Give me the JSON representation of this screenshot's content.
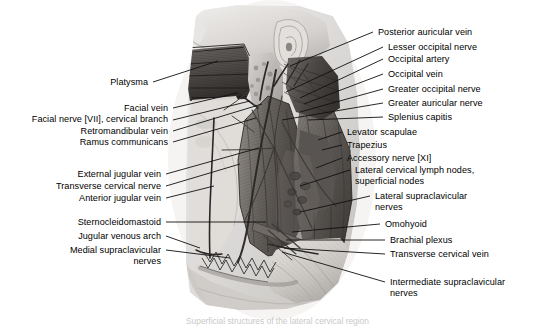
{
  "plate": {
    "title": "Neck — superficial dissection, lateral view",
    "background_color": "#ffffff",
    "ink_color": "#000000",
    "leader_color": "#101010",
    "caption_text": "Superficial structures of the lateral cervical region"
  },
  "labels_left": [
    {
      "id": "platysma",
      "text": "Platysma",
      "text2": ""
    },
    {
      "id": "facial-vein",
      "text": "Facial vein",
      "text2": ""
    },
    {
      "id": "facial-nerve-vii",
      "text": "Facial nerve [VII], cervical branch",
      "text2": ""
    },
    {
      "id": "retromandibular-vein",
      "text": "Retromandibular vein",
      "text2": ""
    },
    {
      "id": "ramus-communicans",
      "text": "Ramus communicans",
      "text2": ""
    },
    {
      "id": "external-jugular-vein",
      "text": "External jugular vein",
      "text2": ""
    },
    {
      "id": "transverse-cervical-nerve",
      "text": "Transverse cervical nerve",
      "text2": ""
    },
    {
      "id": "anterior-jugular-vein",
      "text": "Anterior jugular vein",
      "text2": ""
    },
    {
      "id": "sternocleidomastoid",
      "text": "Sternocleidomastoid",
      "text2": ""
    },
    {
      "id": "jugular-venous-arch",
      "text": "Jugular venous arch",
      "text2": ""
    },
    {
      "id": "medial-supraclavicular-nerves",
      "text": "Medial supraclavicular",
      "text2": "nerves"
    }
  ],
  "labels_right": [
    {
      "id": "posterior-auricular-vein",
      "text": "Posterior auricular vein",
      "text2": ""
    },
    {
      "id": "lesser-occipital-nerve",
      "text": "Lesser occipital nerve",
      "text2": ""
    },
    {
      "id": "occipital-artery",
      "text": "Occipital artery",
      "text2": ""
    },
    {
      "id": "occipital-vein",
      "text": "Occipital vein",
      "text2": ""
    },
    {
      "id": "greater-occipital-nerve",
      "text": "Greater occipital nerve",
      "text2": ""
    },
    {
      "id": "greater-auricular-nerve",
      "text": "Greater auricular nerve",
      "text2": ""
    },
    {
      "id": "splenius-capitis",
      "text": "Splenius capitis",
      "text2": ""
    },
    {
      "id": "levator-scapulae",
      "text": "Levator scapulae",
      "text2": ""
    },
    {
      "id": "trapezius",
      "text": "Trapezius",
      "text2": ""
    },
    {
      "id": "accessory-nerve-xi",
      "text": "Accessory nerve [XI]",
      "text2": ""
    },
    {
      "id": "lateral-cervical-lymph-nodes",
      "text": "Lateral cervical lymph nodes,",
      "text2": "superficial nodes"
    },
    {
      "id": "lateral-supraclavicular-nerves",
      "text": "Lateral supraclavicular",
      "text2": "nerves"
    },
    {
      "id": "omohyoid",
      "text": "Omohyoid",
      "text2": ""
    },
    {
      "id": "brachial-plexus",
      "text": "Brachial plexus",
      "text2": ""
    },
    {
      "id": "transverse-cervical-vein",
      "text": "Transverse cervical vein",
      "text2": ""
    },
    {
      "id": "intermediate-supraclavicular-nerves",
      "text": "Intermediate supraclavicular",
      "text2": "nerves"
    }
  ]
}
